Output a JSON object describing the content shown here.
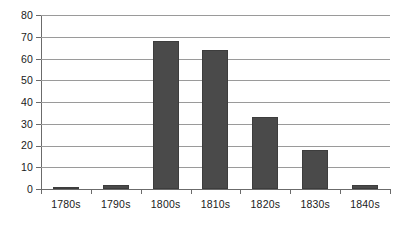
{
  "chart_data": {
    "type": "bar",
    "title": "",
    "subtitle": "",
    "xlabel": "",
    "ylabel": "",
    "categories": [
      "1780s",
      "1790s",
      "1800s",
      "1810s",
      "1820s",
      "1830s",
      "1840s"
    ],
    "values": [
      1,
      2,
      68,
      64,
      33,
      18,
      2
    ],
    "series": [
      {
        "name": "",
        "values": [
          1,
          2,
          68,
          64,
          33,
          18,
          2
        ]
      }
    ],
    "ylim": [
      0,
      80
    ],
    "y_ticks": [
      0,
      10,
      20,
      30,
      40,
      50,
      60,
      70,
      80
    ],
    "y_tick_labels": [
      "0",
      "10",
      "20",
      "30",
      "40",
      "50",
      "60",
      "70",
      "80"
    ],
    "grid": true,
    "grid_axis": "y",
    "legend": false,
    "legend_position": "none",
    "colors": {
      "bar_fill": "#4a4a4a",
      "bar_border": "#3d3d3d",
      "gridline": "#9a9a9a",
      "axis": "#6b6b6b",
      "text": "#1a1a1a",
      "background": "#ffffff"
    }
  }
}
